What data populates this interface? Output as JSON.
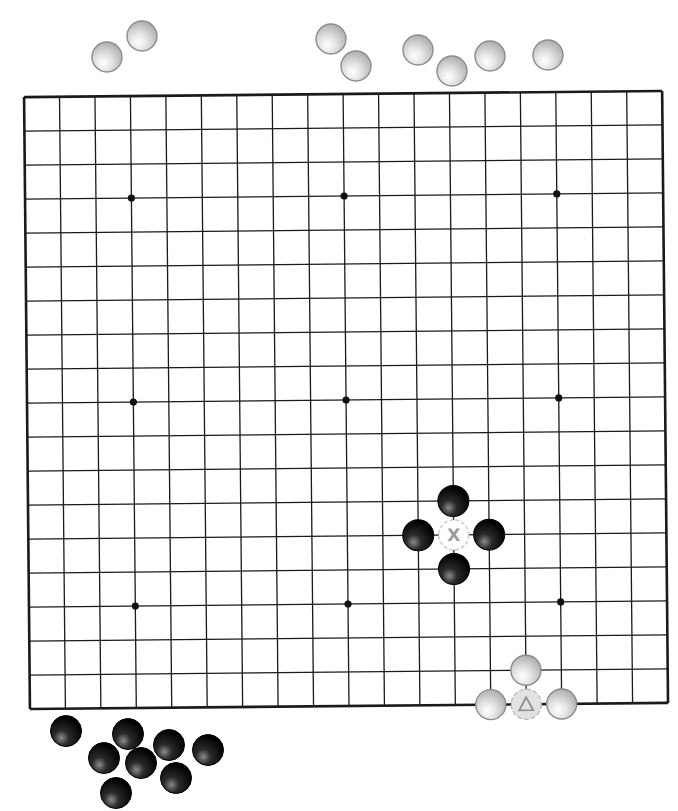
{
  "board": {
    "size": 19,
    "star_points": [
      [
        3,
        3
      ],
      [
        9,
        3
      ],
      [
        15,
        3
      ],
      [
        3,
        9
      ],
      [
        9,
        9
      ],
      [
        15,
        9
      ],
      [
        3,
        15
      ],
      [
        9,
        15
      ],
      [
        15,
        15
      ]
    ],
    "line_color": "#1a1a1a",
    "background": "#ffffff"
  },
  "stones_on_board": [
    {
      "color": "black",
      "col": 12,
      "row": 12
    },
    {
      "color": "black",
      "col": 11,
      "row": 13
    },
    {
      "color": "black",
      "col": 13,
      "row": 13
    },
    {
      "color": "black",
      "col": 12,
      "row": 14
    },
    {
      "color": "white",
      "col": 14,
      "row": 17
    },
    {
      "color": "white",
      "col": 13,
      "row": 18
    },
    {
      "color": "white",
      "col": 15,
      "row": 18,
      "marker": null
    }
  ],
  "markers": [
    {
      "type": "cross",
      "label": "X",
      "col": 12,
      "row": 13,
      "on": "empty-ghost"
    },
    {
      "type": "triangle",
      "label": "△",
      "col": 14,
      "row": 18,
      "on": "white-ghost"
    }
  ],
  "captured_white_stones": [
    {
      "x": 107,
      "y": 57
    },
    {
      "x": 142,
      "y": 36
    },
    {
      "x": 331,
      "y": 39
    },
    {
      "x": 356,
      "y": 66
    },
    {
      "x": 418,
      "y": 50
    },
    {
      "x": 452,
      "y": 71
    },
    {
      "x": 490,
      "y": 56
    },
    {
      "x": 548,
      "y": 55
    }
  ],
  "captured_black_stones": [
    {
      "x": 66,
      "y": 731
    },
    {
      "x": 128,
      "y": 734
    },
    {
      "x": 104,
      "y": 758
    },
    {
      "x": 141,
      "y": 763
    },
    {
      "x": 169,
      "y": 745
    },
    {
      "x": 208,
      "y": 750
    },
    {
      "x": 176,
      "y": 778
    },
    {
      "x": 116,
      "y": 793
    }
  ],
  "labels": {
    "cross_marker": "X",
    "triangle_marker": "△"
  }
}
